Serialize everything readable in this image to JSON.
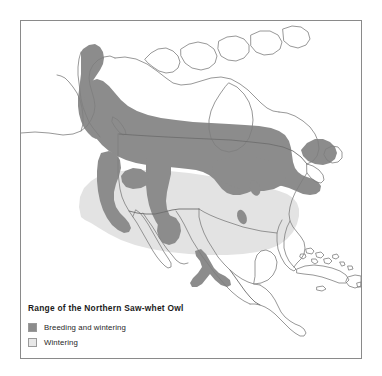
{
  "figure": {
    "type": "range-map",
    "region": "North America and Central America",
    "background_color": "#ffffff",
    "frame_color": "#8a8a8a"
  },
  "legend": {
    "title": "Range of the Northern Saw-whet Owl",
    "items": [
      {
        "label": "Breeding and wintering",
        "swatch_color": "#8c8c8c",
        "swatch_border": "#9a9a9a",
        "icon": "legend-swatch-icon"
      },
      {
        "label": "Wintering",
        "swatch_color": "#e8e8e8",
        "swatch_border": "#9a9a9a",
        "icon": "legend-swatch-icon"
      }
    ]
  },
  "map_layers": {
    "coastline_color": "#7d7d7d",
    "border_color": "#6e6e6e",
    "breeding_and_wintering_color": "#8c8c8c",
    "wintering_color": "#e3e3e3",
    "land_color": "#ffffff",
    "water_color": "#ffffff"
  },
  "geography": {
    "coastlines": [
      {
        "name": "alaska-north-and-aleutians",
        "d": "M0 113 L18 112 L30 115 L44 118 L54 117 L62 113 L68 109 L74 105 L80 100 L86 94 L92 87 L97 80 L101 72 L104 64 L106 56 L107 48 L106 40 L103 33 L98 28 L92 25 L86 24 L81 26 L78 30 L76 35 L77 41 L80 46 L84 50 L86 55 L85 60 L81 63 L76 64 L71 62 L67 58 L64 53 L61 49 L57 47 L52 48 L49 52 L48 58 L50 64 L54 69 L58 73 L60 78 L58 82 L53 83 L47 81 L42 78 L37 76 L31 76 L26 79 L22 84 L19 90 L16 96 L12 102 L6 108 L0 113 Z"
      },
      {
        "name": "canada-arctic-islands-west",
        "d": "M128 36 L134 30 L141 27 L148 28 L154 32 L158 37 L160 43 L158 49 L153 52 L147 52 L141 49 L136 45 L131 41 Z"
      },
      {
        "name": "canada-arctic-islands-mid",
        "d": "M164 30 L172 25 L181 24 L189 27 L194 33 L195 40 L191 46 L184 49 L176 48 L169 44 L165 38 Z"
      },
      {
        "name": "hudson-bay",
        "d": "M238 100 L246 96 L255 95 L263 98 L269 104 L272 112 L271 121 L267 129 L260 135 L251 138 L242 137 L235 132 L231 124 L231 114 L234 106 Z"
      }
    ],
    "outline_note": "Continental and island outlines are drawn as a single composite path in the template SVG."
  },
  "annotations": {
    "breeding_patches": [
      {
        "name": "boreal-canada-band",
        "description": "Broad transcontinental band across southern Canada from Alaska panhandle to Newfoundland"
      },
      {
        "name": "rocky-mountains",
        "description": "Dark corridor down the Rocky Mountains into the Southwest"
      },
      {
        "name": "sierra-nevada-cascades",
        "description": "Dark corridor along the Pacific coastal ranges"
      },
      {
        "name": "appalachian-patch-north",
        "description": "Small isolated oval patch in the central Appalachians"
      },
      {
        "name": "appalachian-patch-south",
        "description": "Small isolated oval patch in the southern Appalachians"
      },
      {
        "name": "sierra-madre-mexico",
        "description": "Y-shaped dark patch in the highlands of southern Mexico"
      }
    ],
    "wintering_patches": [
      {
        "name": "lower-48-wintering",
        "description": "Light gray wintering range covering most of the contiguous United States"
      }
    ]
  }
}
